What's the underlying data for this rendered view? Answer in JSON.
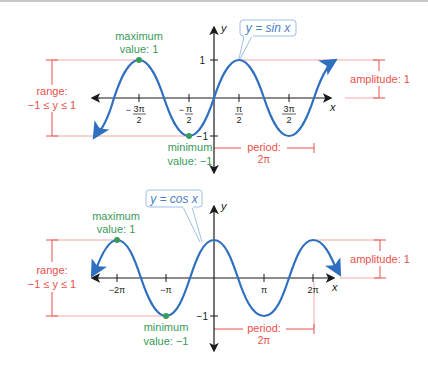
{
  "colors": {
    "curve": "#2f6fc0",
    "annotation_red": "#e8504a",
    "annotation_green": "#3a9a5a",
    "callout_border": "#9cc0e6",
    "axis": "#1a1a1a"
  },
  "sine_graph": {
    "callout": "y = sin x",
    "y_axis_label": "y",
    "x_axis_label": "x",
    "y_ticks": [
      "1",
      "−1"
    ],
    "x_ticks": [
      "−3π/2",
      "−π/2",
      "π/2",
      "3π/2"
    ],
    "max_label_1": "maximum",
    "max_label_2": "value: 1",
    "min_label_1": "minimum",
    "min_label_2": "value: −1",
    "range_label_1": "range:",
    "range_label_2": "−1 ≤ y ≤ 1",
    "amplitude_label": "amplitude: 1",
    "period_label_1": "period:",
    "period_label_2": "2π"
  },
  "cosine_graph": {
    "callout": "y = cos x",
    "y_axis_label": "y",
    "x_axis_label": "x",
    "y_ticks": [
      "−1"
    ],
    "x_ticks": [
      "−2π",
      "−π",
      "π",
      "2π"
    ],
    "max_label_1": "maximum",
    "max_label_2": "value: 1",
    "min_label_1": "minimum",
    "min_label_2": "value: −1",
    "range_label_1": "range:",
    "range_label_2": "−1 ≤ y ≤ 1",
    "amplitude_label": "amplitude: 1",
    "period_label_1": "period:",
    "period_label_2": "2π"
  }
}
